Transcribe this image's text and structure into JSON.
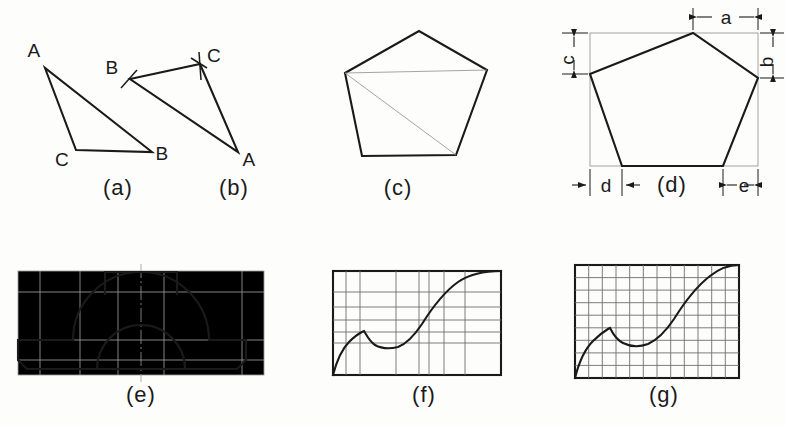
{
  "plate": {
    "title": "Transferring plane figures — construction methods",
    "width": 786,
    "height": 425,
    "ink_color": "#1a1a1a",
    "construction_color": "#9a9a9a",
    "grid_color": "#6e6e6e",
    "background": "#fdfdfc"
  },
  "figures": [
    {
      "key": "a",
      "caption": "(a)",
      "caption_x": 118,
      "caption_y": 192,
      "type": "triangle-given",
      "description": "Given triangle with lettered vertices",
      "vertices": [
        {
          "label": "A",
          "x": 45,
          "y": 68,
          "label_x": 34,
          "label_y": 57
        },
        {
          "label": "C",
          "x": 76,
          "y": 150,
          "label_x": 62,
          "label_y": 162
        },
        {
          "label": "B",
          "x": 152,
          "y": 152,
          "label_x": 158,
          "label_y": 158
        }
      ]
    },
    {
      "key": "b",
      "caption": "(b)",
      "caption_x": 234,
      "caption_y": 192,
      "type": "triangle-constructed",
      "description": "Copied triangle showing compass arc intersection ticks at B and C",
      "vertices": [
        {
          "label": "B",
          "x": 130,
          "y": 79,
          "label_x": 112,
          "label_y": 70
        },
        {
          "label": "C",
          "x": 200,
          "y": 64,
          "label_x": 208,
          "label_y": 58
        },
        {
          "label": "A",
          "x": 238,
          "y": 152,
          "label_x": 244,
          "label_y": 164
        }
      ],
      "arc_ticks": [
        {
          "at": "B",
          "x": 130,
          "y": 79
        },
        {
          "at": "C",
          "x": 200,
          "y": 64
        }
      ]
    },
    {
      "key": "c",
      "caption": "(c)",
      "caption_x": 398,
      "caption_y": 192,
      "type": "pentagon-diagonals",
      "description": "Irregular pentagon divided into triangles by diagonals from one vertex",
      "points": [
        {
          "x": 345,
          "y": 73
        },
        {
          "x": 419,
          "y": 31
        },
        {
          "x": 487,
          "y": 70
        },
        {
          "x": 456,
          "y": 155
        },
        {
          "x": 362,
          "y": 156
        }
      ],
      "diagonals": [
        {
          "from": 0,
          "to": 2
        },
        {
          "from": 0,
          "to": 3
        }
      ]
    },
    {
      "key": "d",
      "caption": "(d)",
      "caption_x": 668,
      "caption_y": 192,
      "type": "pentagon-offsets",
      "description": "Same pentagon enclosed in a rectangle, located by offset dimensions",
      "box": {
        "x": 590,
        "y": 33,
        "w": 168,
        "h": 133
      },
      "points": [
        {
          "x": 590,
          "y": 74
        },
        {
          "x": 693,
          "y": 33
        },
        {
          "x": 758,
          "y": 78
        },
        {
          "x": 723,
          "y": 166
        },
        {
          "x": 622,
          "y": 166
        }
      ],
      "dimensions": [
        {
          "label": "a",
          "placement": "top",
          "label_x": 723,
          "label_y": 17
        },
        {
          "label": "b",
          "placement": "right",
          "label_x": 776,
          "label_y": 60
        },
        {
          "label": "c",
          "placement": "left",
          "label_x": 568,
          "label_y": 58
        },
        {
          "label": "d",
          "placement": "bottom-left",
          "label_x": 604,
          "label_y": 190
        },
        {
          "label": "e",
          "placement": "bottom-right",
          "label_x": 742,
          "label_y": 190
        }
      ]
    },
    {
      "key": "e",
      "caption": "(e)",
      "caption_x": 138,
      "caption_y": 402,
      "type": "bearing-block",
      "description": "Symmetrical bearing block outline enlarged within a construction rectangle",
      "box": {
        "x": 18,
        "y": 271,
        "w": 246,
        "h": 104
      }
    },
    {
      "key": "f",
      "caption": "(f)",
      "caption_x": 424,
      "caption_y": 402,
      "type": "curve-nonuniform-grid",
      "description": "Irregular curve transferred with unequally spaced offset lines",
      "box": {
        "x": 333,
        "y": 271,
        "w": 168,
        "h": 104
      }
    },
    {
      "key": "g",
      "caption": "(g)",
      "caption_x": 664,
      "caption_y": 402,
      "type": "curve-uniform-grid",
      "description": "Same irregular curve transferred on a uniform square grid",
      "box": {
        "x": 575,
        "y": 265,
        "w": 164,
        "h": 113
      },
      "grid_columns": 12,
      "grid_rows": 9
    }
  ],
  "curve": {
    "description": "Reverse curve shared by figures (f) and (g): rises, peaks, dips to a valley, then sweeps up to the top right",
    "normalized_points": [
      [
        0.0,
        1.0
      ],
      [
        0.04,
        0.84
      ],
      [
        0.09,
        0.72
      ],
      [
        0.15,
        0.63
      ],
      [
        0.22,
        0.56
      ],
      [
        0.28,
        0.5
      ],
      [
        0.32,
        0.46
      ],
      [
        0.35,
        0.44
      ],
      [
        0.37,
        0.52
      ],
      [
        0.4,
        0.6
      ],
      [
        0.45,
        0.66
      ],
      [
        0.52,
        0.69
      ],
      [
        0.58,
        0.67
      ],
      [
        0.63,
        0.61
      ],
      [
        0.68,
        0.52
      ],
      [
        0.73,
        0.42
      ],
      [
        0.78,
        0.32
      ],
      [
        0.83,
        0.23
      ],
      [
        0.88,
        0.14
      ],
      [
        0.93,
        0.07
      ],
      [
        0.97,
        0.02
      ],
      [
        1.0,
        0.0
      ]
    ]
  }
}
